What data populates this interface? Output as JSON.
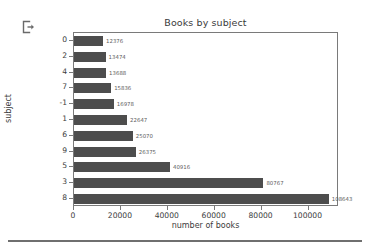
{
  "toolbar": {
    "export_icon": "export-icon"
  },
  "chart_data": {
    "type": "bar",
    "orientation": "horizontal",
    "title": "Books by subject",
    "xlabel": "number of books",
    "ylabel": "subject",
    "categories": [
      "0",
      "2",
      "4",
      "7",
      "-1",
      "1",
      "6",
      "9",
      "5",
      "3",
      "8"
    ],
    "values": [
      12376,
      13474,
      13688,
      15836,
      16978,
      22647,
      25070,
      26375,
      40916,
      80767,
      108643
    ],
    "value_labels": [
      "12376",
      "13474",
      "13688",
      "15836",
      "16978",
      "22647",
      "25070",
      "26375",
      "40916",
      "80767",
      "108643"
    ],
    "xlim": [
      0,
      113000
    ],
    "xticks": [
      0,
      20000,
      40000,
      60000,
      80000,
      100000
    ],
    "xtick_labels": [
      "0",
      "20000",
      "40000",
      "60000",
      "80000",
      "100000"
    ],
    "grid": false,
    "legend": false,
    "bar_color": "#4d4d4d",
    "frame_color": "#7a7a7a",
    "text_color": "#3c3c3c"
  }
}
